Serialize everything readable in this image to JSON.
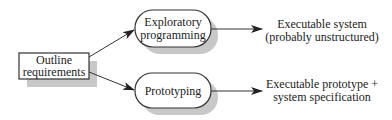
{
  "diagram": {
    "nodes": {
      "outline": {
        "line1": "Outline",
        "line2": "requirements"
      },
      "exploratory": {
        "line1": "Exploratory",
        "line2": "programming"
      },
      "prototyping": {
        "line1": "Prototyping"
      }
    },
    "outputs": {
      "exploratory_result": {
        "line1": "Executable system",
        "line2": "(probably unstructured)"
      },
      "prototyping_result": {
        "line1": "Executable prototype +",
        "line2": "system specification"
      }
    },
    "edges": [
      {
        "from": "outline",
        "to": "exploratory"
      },
      {
        "from": "outline",
        "to": "prototyping"
      },
      {
        "from": "exploratory",
        "to": "exploratory_result"
      },
      {
        "from": "prototyping",
        "to": "prototyping_result"
      }
    ]
  }
}
